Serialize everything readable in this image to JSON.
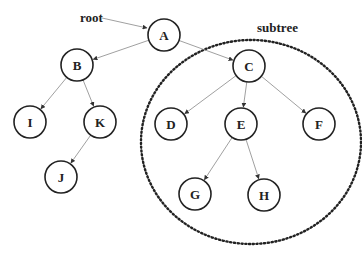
{
  "labels": {
    "root": "root",
    "subtree": "subtree"
  },
  "nodes": [
    {
      "id": "A",
      "label": "A",
      "x": 164,
      "y": 35
    },
    {
      "id": "B",
      "label": "B",
      "x": 77,
      "y": 65
    },
    {
      "id": "I",
      "label": "I",
      "x": 30,
      "y": 122
    },
    {
      "id": "K",
      "label": "K",
      "x": 100,
      "y": 122
    },
    {
      "id": "J",
      "label": "J",
      "x": 61,
      "y": 177
    },
    {
      "id": "C",
      "label": "C",
      "x": 249,
      "y": 66
    },
    {
      "id": "D",
      "label": "D",
      "x": 171,
      "y": 124
    },
    {
      "id": "E",
      "label": "E",
      "x": 241,
      "y": 124
    },
    {
      "id": "F",
      "label": "F",
      "x": 319,
      "y": 124
    },
    {
      "id": "G",
      "label": "G",
      "x": 195,
      "y": 194
    },
    {
      "id": "H",
      "label": "H",
      "x": 264,
      "y": 195
    }
  ],
  "edges": [
    [
      "A",
      "B"
    ],
    [
      "A",
      "C"
    ],
    [
      "B",
      "I"
    ],
    [
      "B",
      "K"
    ],
    [
      "K",
      "J"
    ],
    [
      "C",
      "D"
    ],
    [
      "C",
      "E"
    ],
    [
      "C",
      "F"
    ],
    [
      "E",
      "G"
    ],
    [
      "E",
      "H"
    ]
  ],
  "subtree_region": {
    "cx": 251,
    "cy": 142,
    "rx": 110,
    "ry": 102
  }
}
